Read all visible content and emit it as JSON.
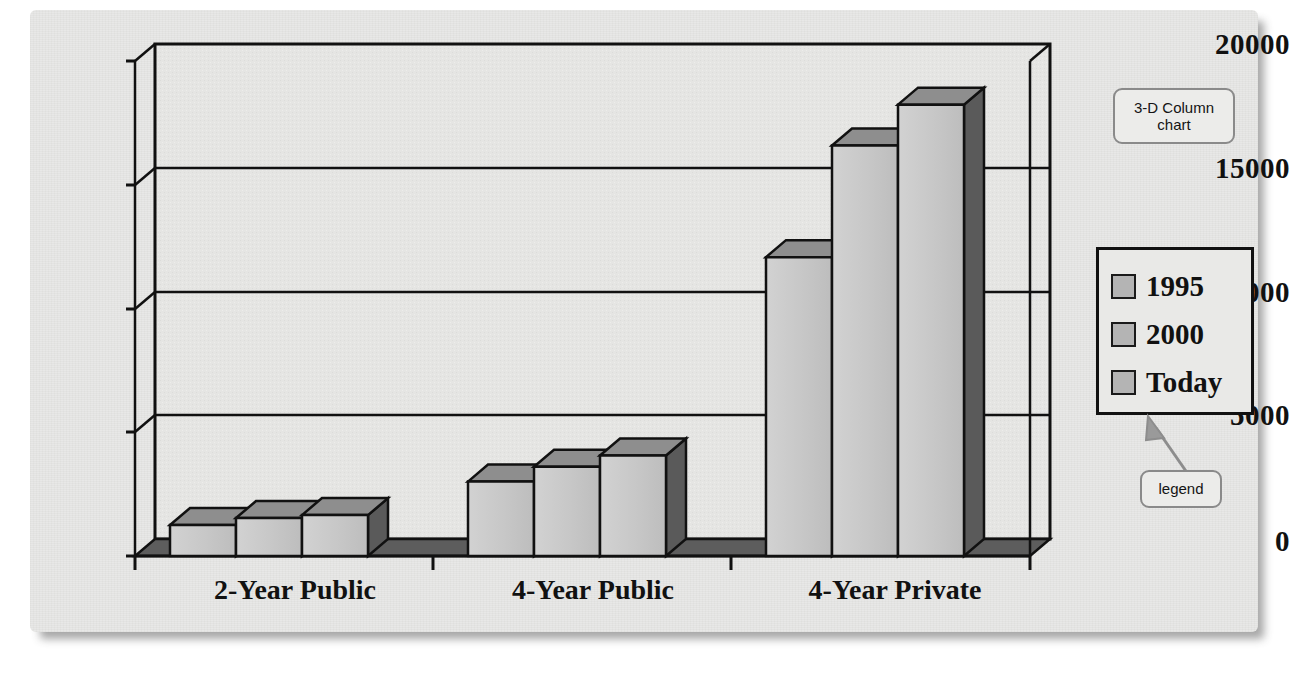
{
  "panel": {
    "background_color": "#e8e8e6"
  },
  "annotations": {
    "chart_type_callout": "3-D Column chart",
    "legend_callout": "legend"
  },
  "legend": {
    "entries": [
      {
        "label": "1995",
        "swatch_color": "#b4b4b4"
      },
      {
        "label": "2000",
        "swatch_color": "#b4b4b4"
      },
      {
        "label": "Today",
        "swatch_color": "#b4b4b4"
      }
    ]
  },
  "chart_data": {
    "type": "bar",
    "title": "",
    "subtitle": "",
    "xlabel": "",
    "ylabel": "",
    "categories": [
      "2-Year Public",
      "4-Year Public",
      "4-Year Private"
    ],
    "series": [
      {
        "name": "1995",
        "values": [
          1250,
          3000,
          12050
        ]
      },
      {
        "name": "2000",
        "values": [
          1530,
          3600,
          16550
        ]
      },
      {
        "name": "Today",
        "values": [
          1650,
          4050,
          18200
        ]
      }
    ],
    "ylim": [
      0,
      20000
    ],
    "ytick_labels": [
      "0",
      "5000",
      "10000",
      "15000",
      "20000"
    ],
    "ytick_values": [
      0,
      5000,
      10000,
      15000,
      20000
    ],
    "grid": true,
    "legend_position": "right",
    "style": "3-D column",
    "colors": {
      "bar_front": "#c9c9c9",
      "bar_top": "#8e8e8e",
      "bar_side": "#5a5a5a",
      "wall": "#e4e4e2",
      "axis": "#111111"
    }
  }
}
